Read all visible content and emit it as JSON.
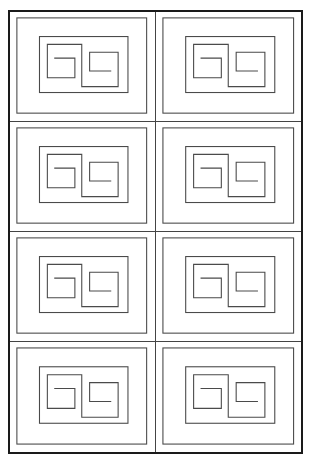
{
  "diagram": {
    "title": "",
    "rows": 4,
    "cols": 2,
    "line_color": "#4a4a4a",
    "frame_color": "#1a1a1a",
    "motif": "nested rectangles with double-spiral (meander) path",
    "cells": [
      {
        "row": 0,
        "col": 0,
        "label": ""
      },
      {
        "row": 0,
        "col": 1,
        "label": ""
      },
      {
        "row": 1,
        "col": 0,
        "label": ""
      },
      {
        "row": 1,
        "col": 1,
        "label": ""
      },
      {
        "row": 2,
        "col": 0,
        "label": ""
      },
      {
        "row": 2,
        "col": 1,
        "label": ""
      },
      {
        "row": 3,
        "col": 0,
        "label": ""
      },
      {
        "row": 3,
        "col": 1,
        "label": ""
      }
    ]
  }
}
